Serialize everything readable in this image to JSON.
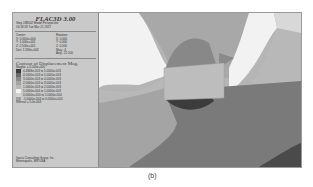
{
  "panel": {
    "title": "FLAC3D 3.00",
    "step_line": "Step 188002  Model Perspective",
    "time_line": "16:18:18 Tue Mar 21 2017",
    "center_label": "Center:",
    "center": [
      "X: 0.000e+000",
      "Y: 1.000e+001",
      "Z: 2.500e+001"
    ],
    "dist": "Dist: 1.580e+002",
    "rotation_label": "Rotation:",
    "rotation": [
      "X:  0.000",
      "Y:  0.000",
      "Z:  0.000"
    ],
    "mag": "Mag.:  4",
    "ang": "Ang.:  22.500",
    "contour_title": "Contour of Displacement Mag.",
    "magfac": "Magfac = 0.000e+000",
    "legend": [
      {
        "label": "4.4868e-003 to 5.0000e-003",
        "color": "#3c3c3c"
      },
      {
        "label": "4.0000e-003 to 5.0000e-003",
        "color": "#6a6a6a"
      },
      {
        "label": "3.0000e-003 to 4.0000e-003",
        "color": "#8a8a8a"
      },
      {
        "label": "2.0000e-003 to 3.0000e-003",
        "color": "#a4a4a4"
      },
      {
        "label": "1.0000e-003 to 2.0000e-003",
        "color": "#b8b8b8"
      },
      {
        "label": "5.0000e-004 to 1.0000e-003",
        "color": "#f2f2f2"
      },
      {
        "label": "0.0000e+000 to 5.0000e-004",
        "color": "#d2d2d2"
      },
      {
        "label": "-5.0000e-004 to 0.0000e+000",
        "color": "#a0a0a0"
      }
    ],
    "interval": "Interval = 5.0e-004",
    "footer": [
      "Itasca Consulting Group, Inc.",
      "Minneapolis, MN USA"
    ]
  },
  "caption": "(b)"
}
